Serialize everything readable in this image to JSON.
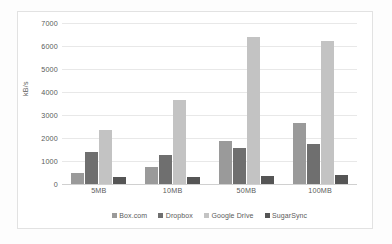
{
  "chart_data": {
    "type": "bar",
    "title": "",
    "subtitle": "",
    "xlabel": "",
    "ylabel": "kB/s",
    "categories": [
      "5MB",
      "10MB",
      "50MB",
      "100MB"
    ],
    "ylim": [
      0,
      7000
    ],
    "yticks": [
      0,
      1000,
      2000,
      3000,
      4000,
      5000,
      6000,
      7000
    ],
    "ytick_labels": [
      "0",
      "1000",
      "2000",
      "3000",
      "4000",
      "5000",
      "6000",
      "7000"
    ],
    "grid": true,
    "legend_position": "bottom",
    "series": [
      {
        "name": "Box.com",
        "color": "#9a9a9a",
        "values": [
          500,
          750,
          1850,
          2650
        ]
      },
      {
        "name": "Dropbox",
        "color": "#6f6f6f",
        "values": [
          1400,
          1250,
          1550,
          1750
        ]
      },
      {
        "name": "Google Drive",
        "color": "#c3c3c3",
        "values": [
          2350,
          3650,
          6400,
          6200
        ]
      },
      {
        "name": "SugarSync",
        "color": "#555555",
        "values": [
          300,
          320,
          350,
          400
        ]
      }
    ]
  },
  "legend": {
    "items": [
      {
        "label": "Box.com",
        "color": "#9a9a9a"
      },
      {
        "label": "Dropbox",
        "color": "#6f6f6f"
      },
      {
        "label": "Google Drive",
        "color": "#c3c3c3"
      },
      {
        "label": "SugarSync",
        "color": "#555555"
      }
    ]
  },
  "axis": {
    "y_title": "kB/s"
  }
}
